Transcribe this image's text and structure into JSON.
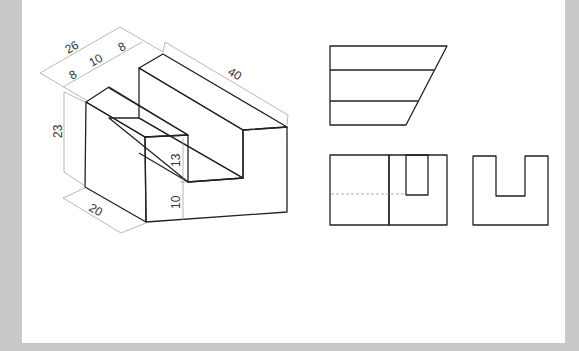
{
  "figure": {
    "type": "orthographic-and-isometric-drawing",
    "isometric_view": {
      "dimensions": {
        "overall_width": "26",
        "left_wall": "8",
        "slot_width": "10",
        "right_wall": "8",
        "length": "40",
        "height": "23",
        "depth": "20",
        "slot_depth": "13",
        "base_height": "10"
      }
    },
    "views": [
      "top-view",
      "front-view",
      "side-view"
    ]
  },
  "colors": {
    "background_border": "#c9c9c9",
    "canvas": "#ffffff",
    "front_face": "#e6e6e6",
    "side_face": "#f2f2f2",
    "top_face": "#fbfbfb",
    "edge": "#222222",
    "dimension_line": "#9a9a9a"
  }
}
